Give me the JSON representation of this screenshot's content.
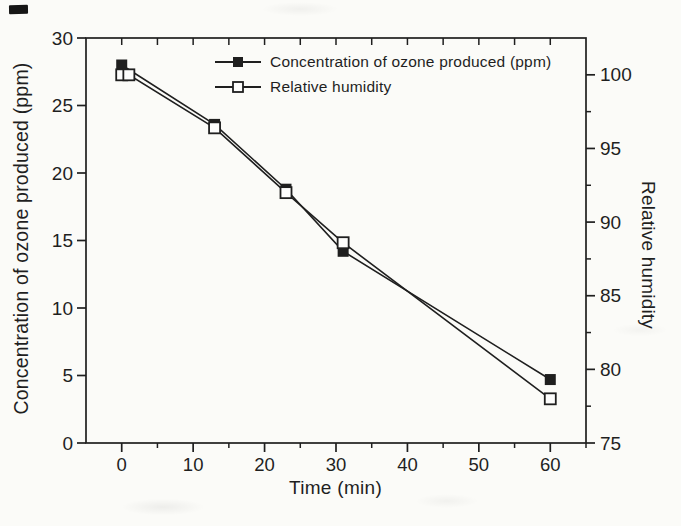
{
  "figure": {
    "paper_color": "#fbfbf8",
    "ink_color": "#1f1f1f"
  },
  "chart_data": {
    "type": "line",
    "title": "",
    "xlabel": "Time (min)",
    "ylabel_left": "Concentration of ozone produced (ppm)",
    "ylabel_right": "Relative humidity",
    "grid": false,
    "legend_position": "inside top, center-right",
    "x_axis": {
      "min": -5,
      "max": 65,
      "major_ticks": [
        0,
        10,
        20,
        30,
        40,
        50,
        60
      ],
      "minor_ticks": [
        5,
        15,
        25,
        35,
        45,
        55,
        65
      ]
    },
    "y_axis_left": {
      "min": 0,
      "max": 30,
      "major_ticks": [
        0,
        5,
        10,
        15,
        20,
        25,
        30
      ]
    },
    "y_axis_right": {
      "min": 75,
      "max": 102.5,
      "major_ticks": [
        75,
        80,
        85,
        90,
        95,
        100
      ],
      "minor_ticks": [
        77.5,
        82.5,
        87.5,
        92.5,
        97.5
      ]
    },
    "series": [
      {
        "name": "Concentration of ozone produced (ppm)",
        "axis": "left",
        "marker": "filled-square",
        "color": "#1f1f1f",
        "points": [
          [
            0,
            28.0
          ],
          [
            13,
            23.6
          ],
          [
            23,
            18.8
          ],
          [
            31,
            14.2
          ],
          [
            60,
            4.7
          ]
        ]
      },
      {
        "name": "Relative humidity",
        "axis": "right",
        "marker": "open-square",
        "color": "#1f1f1f",
        "points": [
          [
            0,
            100
          ],
          [
            1,
            100
          ],
          [
            13,
            96.4
          ],
          [
            23,
            92.0
          ],
          [
            31,
            88.6
          ],
          [
            60,
            78.0
          ]
        ]
      }
    ]
  }
}
